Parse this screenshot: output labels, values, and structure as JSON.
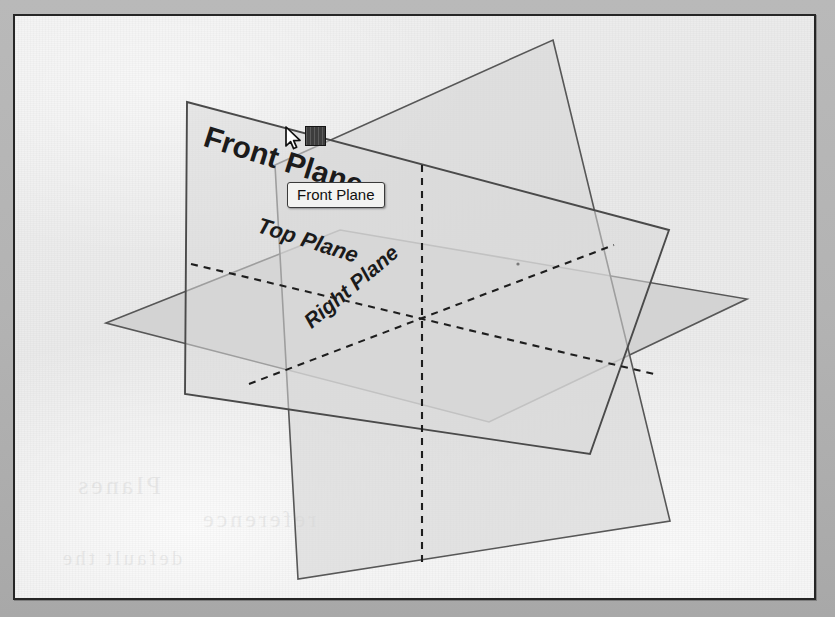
{
  "figure": {
    "kind": "cad-reference-planes-viewport",
    "app_hint": "SolidWorks default reference planes",
    "background_color": "#b3b3b3",
    "paper_color": "#f0f0f0",
    "frame_color": "#262626"
  },
  "tooltip": {
    "text": "Front Plane",
    "background": "#f3f3f1",
    "border_color": "#3a3a3a",
    "text_color": "#101010"
  },
  "cursor": {
    "name": "arrow-pointer",
    "x": 270,
    "y": 110,
    "badge": "drag-move-badge",
    "badge_color": "#3d3d3d"
  },
  "planes": [
    {
      "id": "front",
      "label": "Front Plane",
      "orientation": "vertical-frontal",
      "highlighted": true,
      "fill": "#d9d9d9",
      "stroke": "#555555",
      "points": "185,100 667,228 588,452 183,392"
    },
    {
      "id": "top",
      "label": "Top Plane",
      "orientation": "horizontal",
      "highlighted": false,
      "fill": "#d3d3d3",
      "stroke": "#555555",
      "points": "104,321 338,228 745,297 487,420"
    },
    {
      "id": "right",
      "label": "Right Plane",
      "orientation": "vertical-sagittal",
      "highlighted": false,
      "fill": "#d6d6d6",
      "stroke": "#555555",
      "points": "551,38 668,519 296,577 273,163"
    }
  ],
  "hidden_edges": {
    "style": "dashed",
    "color": "#1f1f1f",
    "center_point": [
      420,
      310
    ],
    "segments": [
      [
        189,
        262,
        652,
        372
      ],
      [
        420,
        163,
        420,
        565
      ],
      [
        247,
        382,
        612,
        243
      ]
    ]
  },
  "labels": {
    "front": "Front Plane",
    "top": "Top Plane",
    "right": "Right Plane"
  },
  "bleed_through": [
    {
      "text": "Planes",
      "x": 80,
      "y": 470,
      "size": 30
    },
    {
      "text": "reference",
      "x": 200,
      "y": 505,
      "size": 26
    },
    {
      "text": "default the",
      "x": 60,
      "y": 545,
      "size": 22
    }
  ]
}
